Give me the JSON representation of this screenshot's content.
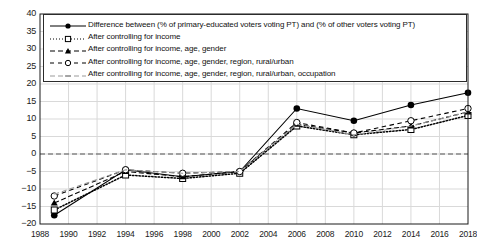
{
  "chart_data": {
    "type": "line",
    "title": "",
    "xlabel": "",
    "ylabel": "",
    "xlim": [
      1988,
      2018
    ],
    "ylim": [
      -20,
      40
    ],
    "ytick_step": 5,
    "xtick_step": 2,
    "grid": true,
    "zero_reference_line": true,
    "legend_position": "top-inside",
    "x_ticks": [
      1988,
      1990,
      1992,
      1994,
      1996,
      1998,
      2000,
      2002,
      2004,
      2006,
      2008,
      2010,
      2012,
      2014,
      2016,
      2018
    ],
    "y_ticks": [
      40,
      35,
      30,
      25,
      20,
      15,
      10,
      5,
      0,
      "−5",
      "−10",
      "−15",
      "−20"
    ],
    "x": [
      1989,
      1994,
      1998,
      2002,
      2006,
      2010,
      2014,
      2018
    ],
    "series": [
      {
        "name": "Difference between (% of primary-educated voters voting PT) and (% of other voters voting PT)",
        "marker": "filled-circle",
        "line": "solid",
        "color": "#000000",
        "values": [
          -17.5,
          -4.5,
          -6.5,
          -5.0,
          13.0,
          9.5,
          14.0,
          17.5
        ]
      },
      {
        "name": "After controlling for income",
        "marker": "open-square",
        "line": "dotted",
        "color": "#000000",
        "values": [
          -16.0,
          -6.0,
          -7.0,
          -5.5,
          8.0,
          5.5,
          7.0,
          11.0
        ]
      },
      {
        "name": "After controlling for income, age, gender",
        "marker": "filled-triangle",
        "line": "dashed",
        "color": "#000000",
        "values": [
          -14.0,
          -5.0,
          -6.5,
          -5.0,
          8.5,
          6.0,
          8.0,
          12.0
        ]
      },
      {
        "name": "After controlling for income, age, gender, region, rural/urban",
        "marker": "open-circle",
        "line": "dash",
        "color": "#000000",
        "values": [
          -12.0,
          -4.5,
          -5.5,
          -5.0,
          9.0,
          6.0,
          9.5,
          13.0
        ]
      },
      {
        "name": "After controlling for income, age, gender, region, rural/urban, occupation",
        "marker": "none",
        "line": "dash-light",
        "color": "#9a9a9a",
        "values": [
          -11.5,
          -4.5,
          -5.5,
          -5.0,
          8.5,
          5.5,
          8.0,
          12.0
        ]
      }
    ]
  },
  "colors": {
    "grid": "#d9d9d9",
    "axis": "#1a1a1a",
    "zero_line": "#555555",
    "plot_background": "#ffffff"
  }
}
